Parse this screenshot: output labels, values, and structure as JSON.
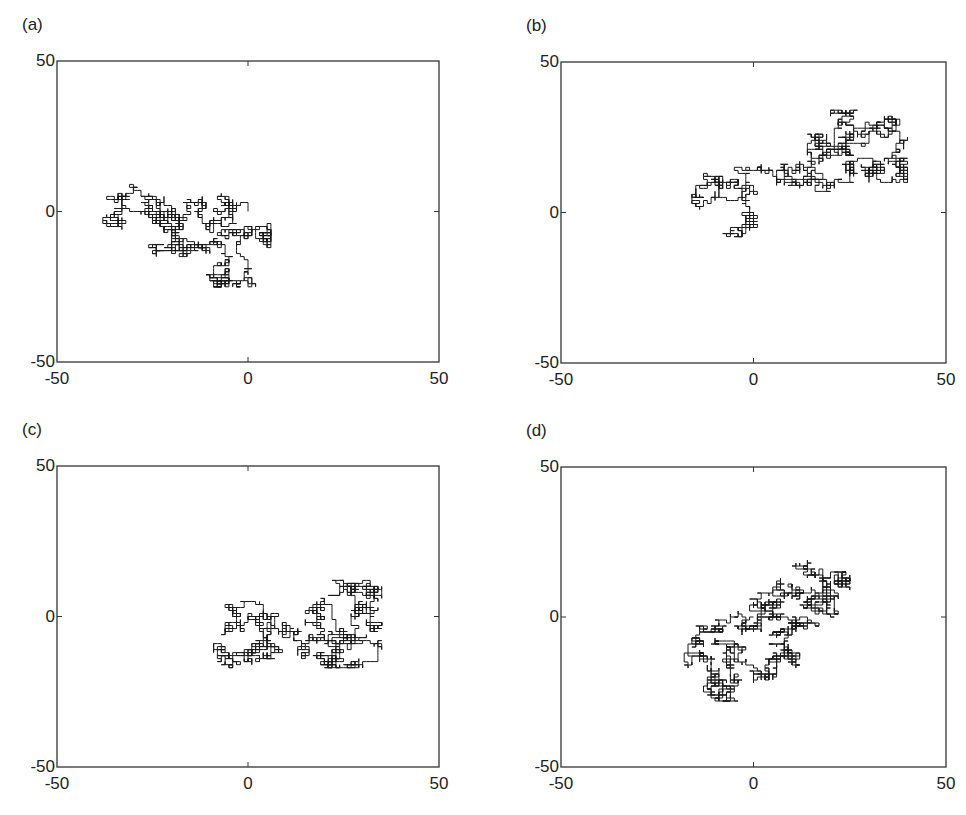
{
  "chart_data": [
    {
      "type": "line",
      "panel_label": "(a)",
      "title": "",
      "xlabel": "",
      "ylabel": "",
      "xlim": [
        -50,
        50
      ],
      "ylim": [
        -50,
        50
      ],
      "xticks": [
        -50,
        0,
        50
      ],
      "yticks": [
        -50,
        0,
        50
      ],
      "xtick_labels": [
        "-50",
        "0",
        "50"
      ],
      "ytick_labels": [
        "-50",
        "0",
        "50"
      ],
      "grid": false,
      "description": "2D lattice random walk starting at origin",
      "extent": {
        "xmin": -38,
        "xmax": 6,
        "ymin": -25,
        "ymax": 9
      },
      "waypoints": [
        [
          0,
          0
        ],
        [
          -6,
          2
        ],
        [
          -5,
          -2
        ],
        [
          -12,
          -3
        ],
        [
          -14,
          2
        ],
        [
          -20,
          -4
        ],
        [
          -28,
          0
        ],
        [
          -36,
          -2
        ],
        [
          -33,
          6
        ],
        [
          -24,
          5
        ],
        [
          -22,
          -2
        ],
        [
          -18,
          -8
        ],
        [
          -14,
          -14
        ],
        [
          -22,
          -13
        ],
        [
          -8,
          -12
        ],
        [
          -5,
          -20
        ],
        [
          -10,
          -24
        ],
        [
          -1,
          -24
        ],
        [
          -4,
          -7
        ],
        [
          2,
          -8
        ],
        [
          6,
          -7
        ]
      ],
      "steps": 2600,
      "seed": 11
    },
    {
      "type": "line",
      "panel_label": "(b)",
      "title": "",
      "xlabel": "",
      "ylabel": "",
      "xlim": [
        -50,
        50
      ],
      "ylim": [
        -50,
        50
      ],
      "xticks": [
        -50,
        0,
        50
      ],
      "yticks": [
        -50,
        0,
        50
      ],
      "xtick_labels": [
        "-50",
        "0",
        "50"
      ],
      "ytick_labels": [
        "-50",
        "0",
        "50"
      ],
      "grid": false,
      "description": "2D lattice random walk starting at origin",
      "extent": {
        "xmin": -16,
        "xmax": 40,
        "ymin": -9,
        "ymax": 34
      },
      "waypoints": [
        [
          0,
          0
        ],
        [
          -3,
          -3
        ],
        [
          -5,
          -6
        ],
        [
          -2,
          3
        ],
        [
          -8,
          7
        ],
        [
          -14,
          10
        ],
        [
          -15,
          4
        ],
        [
          -6,
          11
        ],
        [
          -1,
          10
        ],
        [
          2,
          15
        ],
        [
          6,
          16
        ],
        [
          12,
          14
        ],
        [
          16,
          20
        ],
        [
          13,
          26
        ],
        [
          20,
          19
        ],
        [
          24,
          22
        ],
        [
          22,
          32
        ],
        [
          28,
          29
        ],
        [
          26,
          22
        ],
        [
          34,
          27
        ],
        [
          38,
          29
        ],
        [
          36,
          16
        ],
        [
          40,
          16
        ],
        [
          38,
          12
        ],
        [
          32,
          13
        ],
        [
          30,
          17
        ],
        [
          24,
          12
        ],
        [
          17,
          11
        ],
        [
          12,
          12
        ]
      ],
      "steps": 2600,
      "seed": 23
    },
    {
      "type": "line",
      "panel_label": "(c)",
      "title": "",
      "xlabel": "",
      "ylabel": "",
      "xlim": [
        -50,
        50
      ],
      "ylim": [
        -50,
        50
      ],
      "xticks": [
        -50,
        0,
        50
      ],
      "yticks": [
        -50,
        0,
        50
      ],
      "xtick_labels": [
        "-50",
        "0",
        "50"
      ],
      "ytick_labels": [
        "-50",
        "0",
        "50"
      ],
      "grid": false,
      "description": "2D lattice random walk starting at origin",
      "extent": {
        "xmin": -9,
        "xmax": 35,
        "ymin": -17,
        "ymax": 12
      },
      "waypoints": [
        [
          0,
          0
        ],
        [
          -4,
          -3
        ],
        [
          -2,
          2
        ],
        [
          4,
          -2
        ],
        [
          6,
          -9
        ],
        [
          -2,
          -12
        ],
        [
          -8,
          -12
        ],
        [
          -4,
          -14
        ],
        [
          5,
          -12
        ],
        [
          8,
          -4
        ],
        [
          12,
          -5
        ],
        [
          15,
          -10
        ],
        [
          18,
          -5
        ],
        [
          20,
          2
        ],
        [
          23,
          -6
        ],
        [
          26,
          -9
        ],
        [
          21,
          -13
        ],
        [
          24,
          -16
        ],
        [
          30,
          -15
        ],
        [
          28,
          -6
        ],
        [
          30,
          5
        ],
        [
          27,
          11
        ],
        [
          32,
          9
        ],
        [
          35,
          7
        ],
        [
          30,
          2
        ],
        [
          35,
          -2
        ]
      ],
      "steps": 2600,
      "seed": 37
    },
    {
      "type": "line",
      "panel_label": "(d)",
      "title": "",
      "xlabel": "",
      "ylabel": "",
      "xlim": [
        -50,
        50
      ],
      "ylim": [
        -50,
        50
      ],
      "xticks": [
        -50,
        0,
        50
      ],
      "yticks": [
        -50,
        0,
        50
      ],
      "xtick_labels": [
        "-50",
        "0",
        "50"
      ],
      "ytick_labels": [
        "-50",
        "0",
        "50"
      ],
      "grid": false,
      "description": "2D lattice random walk starting at origin",
      "extent": {
        "xmin": -18,
        "xmax": 25,
        "ymin": -28,
        "ymax": 19
      },
      "waypoints": [
        [
          0,
          0
        ],
        [
          -5,
          -1
        ],
        [
          -10,
          -2
        ],
        [
          -14,
          -6
        ],
        [
          -17,
          -8
        ],
        [
          -16,
          -14
        ],
        [
          -12,
          -18
        ],
        [
          -8,
          -22
        ],
        [
          -13,
          -24
        ],
        [
          -6,
          -26
        ],
        [
          -8,
          -28
        ],
        [
          -5,
          -20
        ],
        [
          -4,
          -12
        ],
        [
          -7,
          -8
        ],
        [
          -2,
          -17
        ],
        [
          3,
          -17
        ],
        [
          5,
          -12
        ],
        [
          8,
          -14
        ],
        [
          11,
          -14
        ],
        [
          6,
          -9
        ],
        [
          9,
          -6
        ],
        [
          13,
          -5
        ],
        [
          8,
          -3
        ],
        [
          3,
          -2
        ],
        [
          6,
          2
        ],
        [
          3,
          6
        ],
        [
          9,
          10
        ],
        [
          14,
          7
        ],
        [
          16,
          4
        ],
        [
          20,
          3
        ],
        [
          21,
          8
        ],
        [
          16,
          10
        ],
        [
          14,
          18
        ],
        [
          18,
          13
        ],
        [
          23,
          14
        ],
        [
          25,
          12
        ]
      ],
      "steps": 2800,
      "seed": 53
    }
  ],
  "panels": [
    {
      "label": "(a)",
      "box": {
        "x": 57,
        "y": 61,
        "w": 382,
        "h": 301
      }
    },
    {
      "label": "(b)",
      "box": {
        "x": 561,
        "y": 62,
        "w": 385,
        "h": 301
      }
    },
    {
      "label": "(c)",
      "box": {
        "x": 57,
        "y": 466,
        "w": 382,
        "h": 301
      }
    },
    {
      "label": "(d)",
      "box": {
        "x": 561,
        "y": 467,
        "w": 385,
        "h": 300
      }
    }
  ],
  "colors": {
    "walk": "#1a1a1a",
    "axes": "#333333",
    "text": "#222222",
    "background": "#ffffff"
  }
}
